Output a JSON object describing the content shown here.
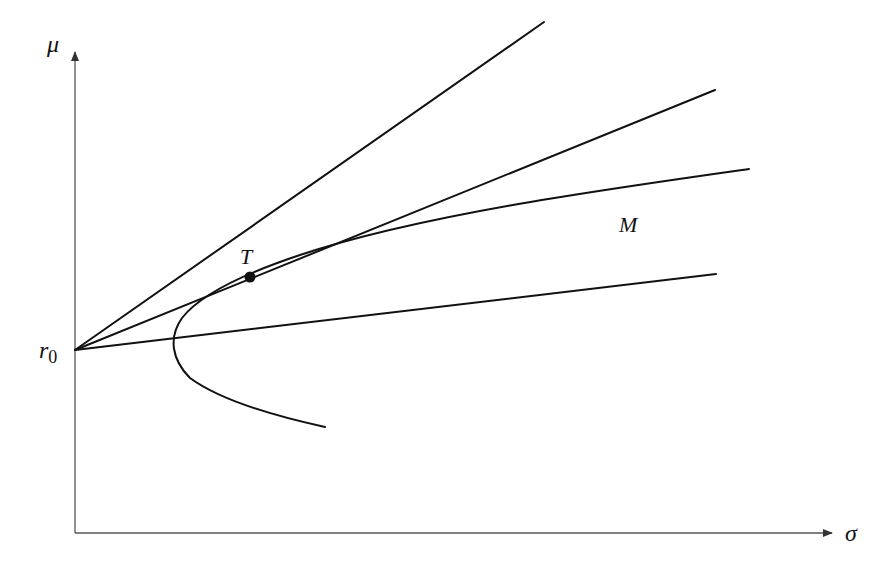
{
  "diagram": {
    "type": "mean-variance efficient frontier with capital allocation lines",
    "axes": {
      "x_label": "σ",
      "y_label": "μ"
    },
    "labels": {
      "intercept": "r",
      "intercept_sub": "0",
      "tangency_point": "T",
      "region": "M"
    },
    "colors": {
      "line": "#111111",
      "axis": "#555555",
      "background": "#ffffff"
    },
    "elements": [
      {
        "name": "steep-line",
        "from": [
          75,
          350
        ],
        "to": [
          544,
          22
        ]
      },
      {
        "name": "tangent-line",
        "from": [
          75,
          350
        ],
        "to": [
          715,
          90
        ]
      },
      {
        "name": "shallow-line",
        "from": [
          75,
          350
        ],
        "to": [
          716,
          274
        ]
      },
      {
        "name": "frontier-hyperbola",
        "vertex": [
          175,
          340
        ],
        "upper_end": [
          749,
          169
        ],
        "lower_end": [
          325,
          427
        ]
      },
      {
        "name": "tangency-point",
        "at": [
          250,
          277
        ]
      }
    ]
  }
}
